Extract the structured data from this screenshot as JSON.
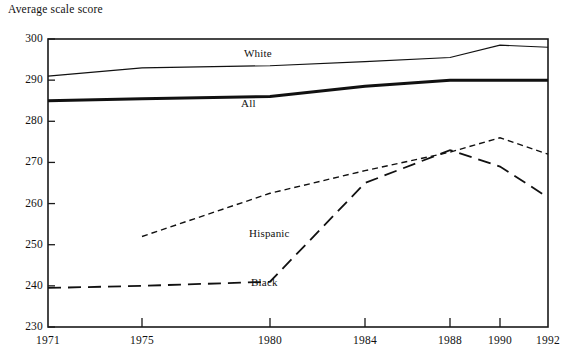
{
  "chart_data": {
    "type": "line",
    "title": "Average scale score",
    "xlabel": "",
    "ylabel": "Average scale score",
    "ylim": [
      230,
      300
    ],
    "yticks": [
      230,
      240,
      250,
      260,
      270,
      280,
      290,
      300
    ],
    "ytick_labels": [
      "230",
      "240",
      "250",
      "260",
      "270",
      "280",
      "290",
      "300"
    ],
    "x": [
      1971,
      1975,
      1980,
      1984,
      1988,
      1990,
      1992
    ],
    "xtick_labels": [
      "1971",
      "1975",
      "1980",
      "1984",
      "1988",
      "1990",
      "1992"
    ],
    "grid": false,
    "legend_position": "inline-labels",
    "series": [
      {
        "name": "White",
        "label": "White",
        "style": "solid-thin",
        "color": "#111111",
        "x": [
          1971,
          1975,
          1980,
          1984,
          1988,
          1990,
          1992
        ],
        "values": [
          291,
          293,
          293.5,
          294.5,
          295.5,
          298.5,
          298
        ]
      },
      {
        "name": "All",
        "label": "All",
        "style": "solid-thick",
        "color": "#111111",
        "x": [
          1971,
          1975,
          1980,
          1984,
          1988,
          1990,
          1992
        ],
        "values": [
          285,
          285.5,
          286,
          288.5,
          290,
          290,
          290
        ]
      },
      {
        "name": "Hispanic",
        "label": "Hispanic",
        "style": "short-dash",
        "color": "#111111",
        "x": [
          1975,
          1980,
          1984,
          1988,
          1990,
          1992
        ],
        "values": [
          252,
          262.5,
          268,
          272.5,
          276,
          272
        ]
      },
      {
        "name": "Black",
        "label": "Black",
        "style": "long-dash",
        "color": "#111111",
        "x": [
          1971,
          1975,
          1980,
          1984,
          1988,
          1990,
          1992
        ],
        "values": [
          239.5,
          240,
          241,
          265,
          273,
          269,
          261.5
        ]
      }
    ],
    "series_label_positions": [
      {
        "name": "White",
        "x": 244,
        "y": 47
      },
      {
        "name": "All",
        "x": 241,
        "y": 97
      },
      {
        "name": "Hispanic",
        "x": 249,
        "y": 227
      },
      {
        "name": "Black",
        "x": 251,
        "y": 276
      }
    ]
  },
  "frame": {
    "left": 48,
    "right": 548,
    "top": 39,
    "bottom": 327
  },
  "tick_x_positions": [
    48,
    142,
    270,
    365,
    450,
    500,
    548
  ]
}
